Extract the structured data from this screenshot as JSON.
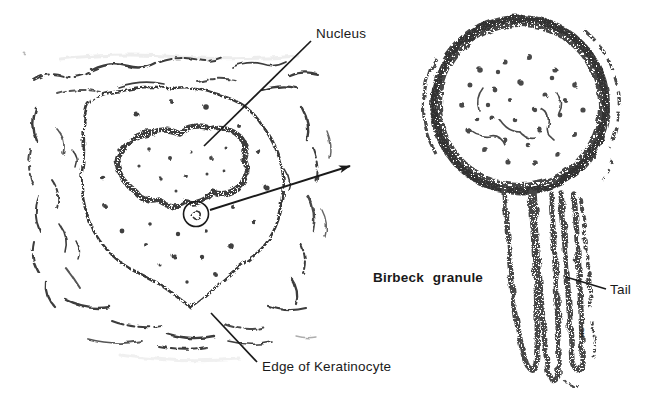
{
  "figure": {
    "background_color": "#ffffff",
    "ink_color": "#1a1a1a",
    "labels": {
      "nucleus": "Nucleus",
      "edge_of_keratinocyte": "Edge of Keratinocyte",
      "birbeck_granule": "Birbeck granule",
      "tail": "Tail",
      "pm_marker": "PM"
    }
  }
}
